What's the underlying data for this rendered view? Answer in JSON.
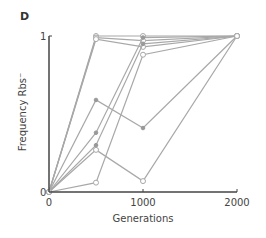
{
  "panel": {
    "label": "D"
  },
  "colors": {
    "line": "#a8a8a8",
    "axis": "#444444",
    "marker_fill": "#999999"
  },
  "chart_data": {
    "type": "line",
    "title": "",
    "xlabel": "Generations",
    "ylabel": "Frequency Rbs⁻",
    "x": [
      0,
      500,
      1000,
      2000
    ],
    "xticks": [
      0,
      1000,
      2000
    ],
    "yticks": [
      0,
      1
    ],
    "xlim": [
      0,
      2000
    ],
    "ylim": [
      0,
      1
    ],
    "grid": false,
    "legend": null,
    "series": [
      {
        "name": "line 1",
        "marker": "open",
        "values": [
          0,
          1.0,
          1.0,
          1.0
        ]
      },
      {
        "name": "line 2",
        "marker": "open",
        "values": [
          0,
          0.99,
          0.97,
          1.0
        ]
      },
      {
        "name": "line 3",
        "marker": "open",
        "values": [
          0,
          0.98,
          0.93,
          1.0
        ]
      },
      {
        "name": "line 4",
        "marker": "filled",
        "values": [
          0,
          0.59,
          0.41,
          1.0
        ]
      },
      {
        "name": "line 5",
        "marker": "filled",
        "values": [
          0,
          0.38,
          0.99,
          1.0
        ]
      },
      {
        "name": "line 6",
        "marker": "filled",
        "values": [
          0,
          0.3,
          0.95,
          1.0
        ]
      },
      {
        "name": "line 7",
        "marker": "open",
        "values": [
          0,
          0.27,
          0.07,
          1.0
        ]
      },
      {
        "name": "line 8",
        "marker": "open",
        "values": [
          0,
          0.06,
          0.88,
          1.0
        ]
      }
    ]
  }
}
